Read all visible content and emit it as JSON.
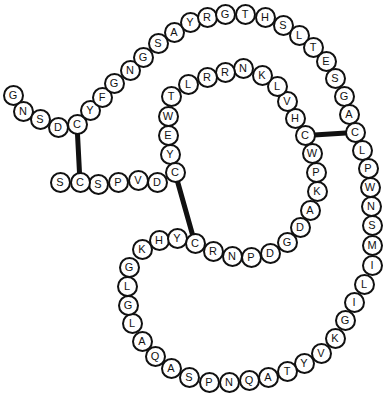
{
  "diagram": {
    "type": "peptide-sequence-chain",
    "residue_count": 97,
    "sequence": "GNSDCYFGNGSAYRGTHSLTESGACLPWNSMILIGKVYTAQNPSAQALGLGKHYCRNPDGDAKPWCHVLKNRRLTWEYCDVPSCS",
    "residues": [
      {
        "letter": "G",
        "x": 13,
        "y": 95
      },
      {
        "letter": "N",
        "x": 23,
        "y": 111
      },
      {
        "letter": "S",
        "x": 40,
        "y": 119
      },
      {
        "letter": "D",
        "x": 58,
        "y": 127
      },
      {
        "letter": "C",
        "x": 77,
        "y": 124
      },
      {
        "letter": "Y",
        "x": 90,
        "y": 110
      },
      {
        "letter": "F",
        "x": 102,
        "y": 97
      },
      {
        "letter": "G",
        "x": 114,
        "y": 83
      },
      {
        "letter": "N",
        "x": 130,
        "y": 70
      },
      {
        "letter": "G",
        "x": 143,
        "y": 57
      },
      {
        "letter": "S",
        "x": 158,
        "y": 43
      },
      {
        "letter": "A",
        "x": 174,
        "y": 32
      },
      {
        "letter": "Y",
        "x": 190,
        "y": 22
      },
      {
        "letter": "R",
        "x": 207,
        "y": 17
      },
      {
        "letter": "G",
        "x": 225,
        "y": 14
      },
      {
        "letter": "T",
        "x": 245,
        "y": 14
      },
      {
        "letter": "H",
        "x": 265,
        "y": 17
      },
      {
        "letter": "S",
        "x": 283,
        "y": 25
      },
      {
        "letter": "L",
        "x": 299,
        "y": 35
      },
      {
        "letter": "T",
        "x": 313,
        "y": 47
      },
      {
        "letter": "E",
        "x": 326,
        "y": 61
      },
      {
        "letter": "S",
        "x": 335,
        "y": 78
      },
      {
        "letter": "G",
        "x": 344,
        "y": 96
      },
      {
        "letter": "A",
        "x": 349,
        "y": 114
      },
      {
        "letter": "C",
        "x": 355,
        "y": 132
      },
      {
        "letter": "L",
        "x": 362,
        "y": 150
      },
      {
        "letter": "P",
        "x": 368,
        "y": 168
      },
      {
        "letter": "W",
        "x": 370,
        "y": 187
      },
      {
        "letter": "N",
        "x": 371,
        "y": 206
      },
      {
        "letter": "S",
        "x": 372,
        "y": 225
      },
      {
        "letter": "M",
        "x": 372,
        "y": 245
      },
      {
        "letter": "I",
        "x": 372,
        "y": 265
      },
      {
        "letter": "L",
        "x": 364,
        "y": 284
      },
      {
        "letter": "I",
        "x": 354,
        "y": 302
      },
      {
        "letter": "G",
        "x": 345,
        "y": 320
      },
      {
        "letter": "K",
        "x": 335,
        "y": 338
      },
      {
        "letter": "V",
        "x": 321,
        "y": 353
      },
      {
        "letter": "Y",
        "x": 304,
        "y": 363
      },
      {
        "letter": "T",
        "x": 287,
        "y": 371
      },
      {
        "letter": "A",
        "x": 268,
        "y": 377
      },
      {
        "letter": "Q",
        "x": 249,
        "y": 380
      },
      {
        "letter": "N",
        "x": 229,
        "y": 382
      },
      {
        "letter": "P",
        "x": 209,
        "y": 382
      },
      {
        "letter": "S",
        "x": 189,
        "y": 377
      },
      {
        "letter": "A",
        "x": 171,
        "y": 368
      },
      {
        "letter": "Q",
        "x": 155,
        "y": 356
      },
      {
        "letter": "A",
        "x": 142,
        "y": 341
      },
      {
        "letter": "L",
        "x": 132,
        "y": 323
      },
      {
        "letter": "G",
        "x": 128,
        "y": 305
      },
      {
        "letter": "L",
        "x": 127,
        "y": 286
      },
      {
        "letter": "G",
        "x": 129,
        "y": 267
      },
      {
        "letter": "K",
        "x": 142,
        "y": 249
      },
      {
        "letter": "H",
        "x": 159,
        "y": 240
      },
      {
        "letter": "Y",
        "x": 177,
        "y": 238
      },
      {
        "letter": "C",
        "x": 195,
        "y": 243
      },
      {
        "letter": "R",
        "x": 213,
        "y": 251
      },
      {
        "letter": "N",
        "x": 232,
        "y": 256
      },
      {
        "letter": "P",
        "x": 251,
        "y": 257
      },
      {
        "letter": "D",
        "x": 270,
        "y": 253
      },
      {
        "letter": "G",
        "x": 287,
        "y": 242
      },
      {
        "letter": "D",
        "x": 300,
        "y": 227
      },
      {
        "letter": "A",
        "x": 310,
        "y": 210
      },
      {
        "letter": "K",
        "x": 317,
        "y": 191
      },
      {
        "letter": "P",
        "x": 316,
        "y": 172
      },
      {
        "letter": "W",
        "x": 312,
        "y": 153
      },
      {
        "letter": "C",
        "x": 305,
        "y": 135
      },
      {
        "letter": "H",
        "x": 295,
        "y": 118
      },
      {
        "letter": "V",
        "x": 287,
        "y": 101
      },
      {
        "letter": "L",
        "x": 277,
        "y": 86
      },
      {
        "letter": "K",
        "x": 262,
        "y": 75
      },
      {
        "letter": "N",
        "x": 243,
        "y": 68
      },
      {
        "letter": "R",
        "x": 225,
        "y": 72
      },
      {
        "letter": "R",
        "x": 207,
        "y": 77
      },
      {
        "letter": "L",
        "x": 188,
        "y": 84
      },
      {
        "letter": "T",
        "x": 171,
        "y": 96
      },
      {
        "letter": "W",
        "x": 168,
        "y": 116
      },
      {
        "letter": "E",
        "x": 168,
        "y": 135
      },
      {
        "letter": "Y",
        "x": 170,
        "y": 154
      },
      {
        "letter": "C",
        "x": 175,
        "y": 172
      },
      {
        "letter": "D",
        "x": 157,
        "y": 182
      },
      {
        "letter": "V",
        "x": 138,
        "y": 180
      },
      {
        "letter": "P",
        "x": 118,
        "y": 182
      },
      {
        "letter": "S",
        "x": 98,
        "y": 184
      },
      {
        "letter": "C",
        "x": 80,
        "y": 182
      },
      {
        "letter": "S",
        "x": 60,
        "y": 182
      }
    ],
    "disulfide_bonds": [
      {
        "from": [
          77,
          124
        ],
        "to": [
          80,
          182
        ]
      },
      {
        "from": [
          175,
          172
        ],
        "to": [
          195,
          243
        ]
      },
      {
        "from": [
          305,
          135
        ],
        "to": [
          355,
          132
        ]
      }
    ],
    "colors": {
      "stroke": "#111111",
      "fill": "#ffffff",
      "background": "#ffffff"
    }
  }
}
